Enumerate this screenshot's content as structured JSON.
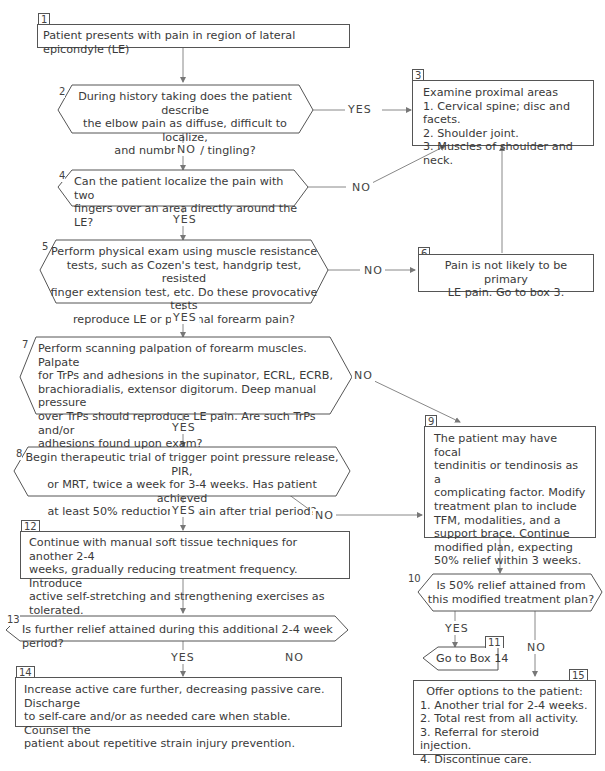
{
  "diagram": {
    "boxes": {
      "b1": {
        "num": "1",
        "text": "Patient presents with pain in region of lateral epicondyle (LE)"
      },
      "b2": {
        "num": "2",
        "lines": [
          "During history taking does the patient describe",
          "the elbow pain as diffuse, difficult to localize,",
          "and numbness / tingling?"
        ]
      },
      "b3": {
        "num": "3",
        "title": "Examine proximal areas",
        "items": [
          "1. Cervical spine; disc and facets.",
          "2. Shoulder joint.",
          "3. Muscles of shoulder and neck."
        ]
      },
      "b4": {
        "num": "4",
        "lines": [
          "Can the patient localize the pain with two",
          "fingers over an area directly around the LE?"
        ]
      },
      "b5": {
        "num": "5",
        "lines": [
          "Perform physical exam using muscle resistance",
          "tests, such as Cozen's test, handgrip test, resisted",
          "finger extension test, etc. Do these provocative tests",
          "reproduce LE or proximal forearm pain?"
        ]
      },
      "b6": {
        "num": "6",
        "lines": [
          "Pain is not likely to be primary",
          "LE pain. Go to box 3."
        ]
      },
      "b7": {
        "num": "7",
        "lines": [
          "Perform scanning palpation of forearm muscles. Palpate",
          "for TrPs and adhesions in the supinator, ECRL, ECRB,",
          "brachioradialis, extensor digitorum. Deep manual pressure",
          "over TrPs should reproduce LE pain. Are such TrPs and/or",
          "adhesions found upon exam?"
        ]
      },
      "b8": {
        "num": "8",
        "lines": [
          "Begin therapeutic trial of trigger point pressure release, PIR,",
          "or MRT, twice a week for 3-4 weeks. Has patient achieved",
          "at least 50% reduction in pain after trial period?"
        ]
      },
      "b9": {
        "num": "9",
        "lines": [
          "The patient may have focal",
          "tendinitis or tendinosis as a",
          "complicating factor. Modify",
          "treatment plan to include",
          "TFM, modalities, and a",
          "support brace. Continue",
          "modified plan, expecting",
          "50% relief within 3 weeks."
        ]
      },
      "b10": {
        "num": "10",
        "lines": [
          "Is 50% relief attained from",
          "this modified treatment plan?"
        ]
      },
      "b11": {
        "num": "11",
        "text": "Go to Box 14"
      },
      "b12": {
        "num": "12",
        "lines": [
          "Continue with manual soft tissue techniques for another 2-4",
          "weeks, gradually reducing treatment frequency. Introduce",
          "active self-stretching and strengthening exercises as tolerated."
        ]
      },
      "b13": {
        "num": "13",
        "text": "Is further relief attained during this additional 2-4 week period?"
      },
      "b14": {
        "num": "14",
        "lines": [
          "Increase active care further, decreasing passive care. Discharge",
          "to self-care and/or as needed care when stable. Counsel the",
          "patient about repetitive strain injury prevention."
        ]
      },
      "b15": {
        "num": "15",
        "title": "Offer options to the patient:",
        "items": [
          "1. Another trial for 2-4 weeks.",
          "2. Total rest from all activity.",
          "3. Referral for steroid injection.",
          "4. Discontinue care."
        ]
      }
    },
    "labels": {
      "yes": "YES",
      "no": "NO"
    }
  }
}
